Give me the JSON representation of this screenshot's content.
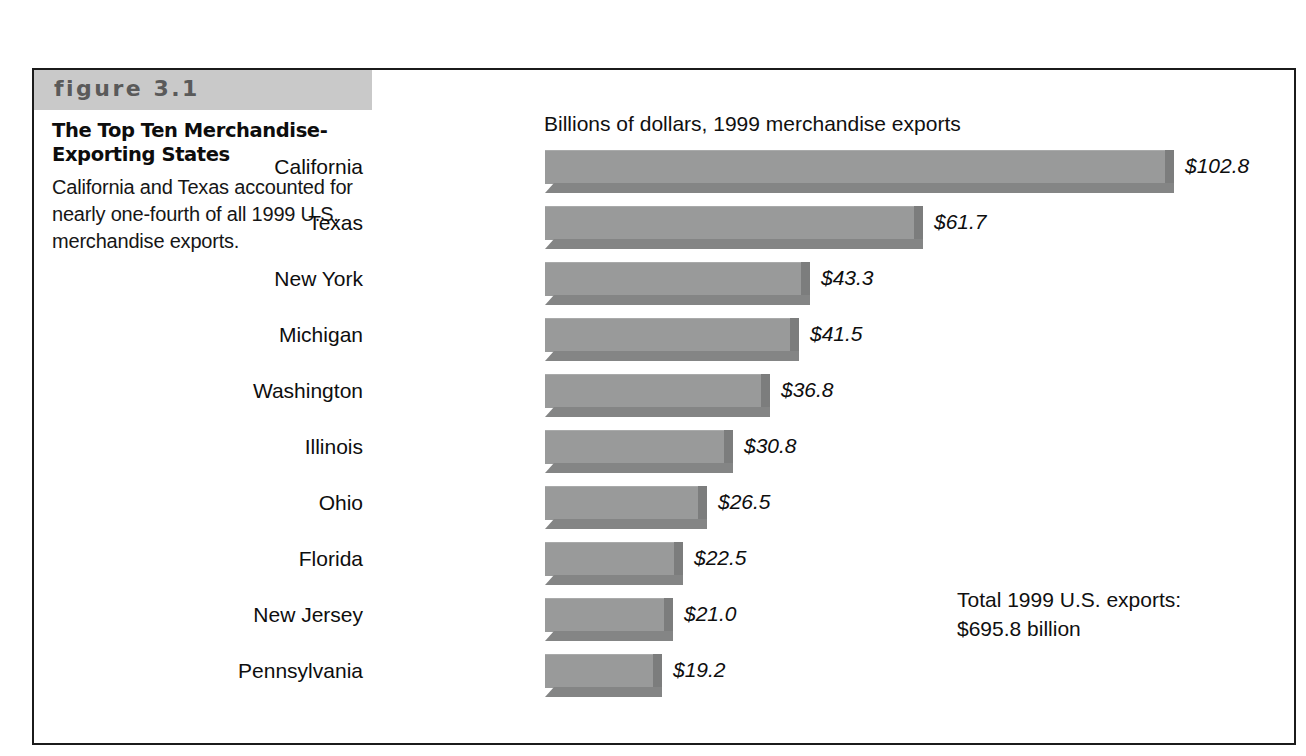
{
  "figure": {
    "number_label": "figure 3.1",
    "title": "The Top Ten Merchandise-Exporting States",
    "caption": "California and Texas accounted for nearly one-fourth of all 1999 U.S. merchandise exports.",
    "border_color": "#1b1b1b",
    "band_color": "#c9c9c9"
  },
  "annotation": {
    "total_line1": "Total 1999 U.S. exports:",
    "total_line2": "$695.8 billion"
  },
  "chart_data": {
    "type": "bar",
    "orientation": "horizontal",
    "title": "Billions of dollars, 1999 merchandise exports",
    "xlabel": "",
    "ylabel": "",
    "xlim": [
      0,
      102.8
    ],
    "grid": false,
    "legend": "none",
    "bar_color": "#999a9a",
    "bar_shadow_color": "#7c7d7d",
    "value_prefix": "$",
    "categories": [
      "California",
      "Texas",
      "New York",
      "Michigan",
      "Washington",
      "Illinois",
      "Ohio",
      "Florida",
      "New Jersey",
      "Pennsylvania"
    ],
    "values": [
      102.8,
      61.7,
      43.3,
      41.5,
      36.8,
      30.8,
      26.5,
      22.5,
      21.0,
      19.2
    ],
    "value_labels": [
      "$102.8",
      "$61.7",
      "$43.3",
      "$41.5",
      "$36.8",
      "$30.8",
      "$26.5",
      "$22.5",
      "$21.0",
      "$19.2"
    ],
    "annotations": [
      "Total 1999 U.S. exports:",
      "$695.8 billion"
    ]
  }
}
